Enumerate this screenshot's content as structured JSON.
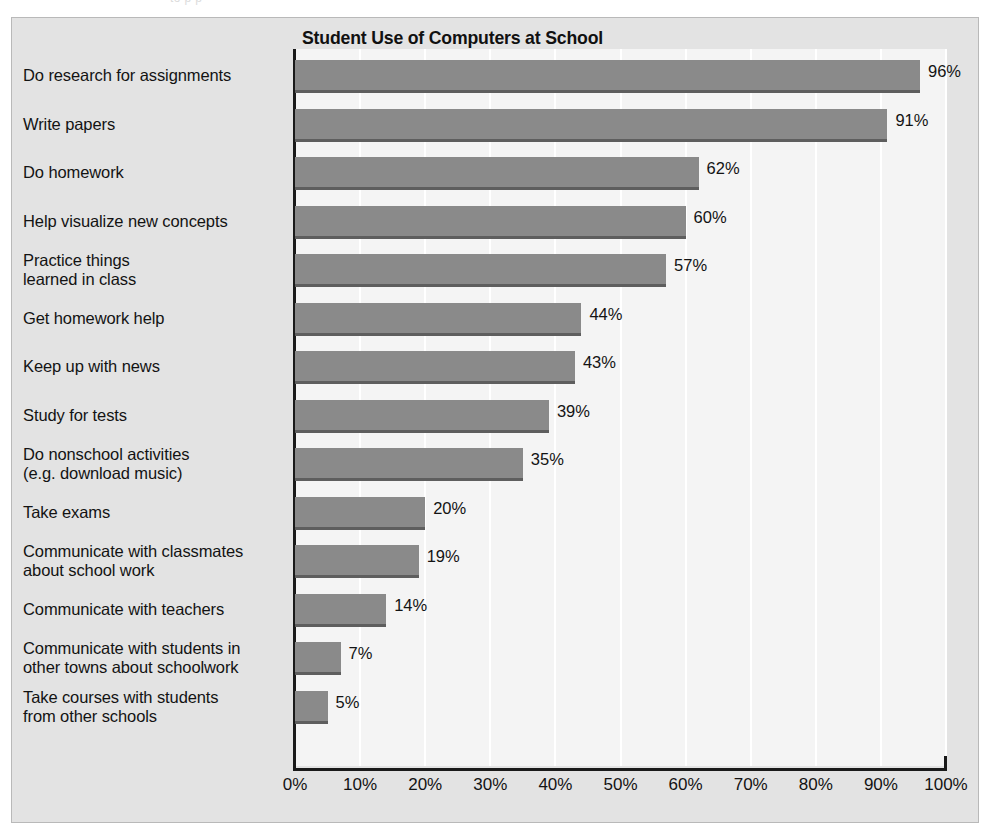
{
  "figure": {
    "ghost_caption": "to  p           p                                                                                                  "
  },
  "chart_data": {
    "type": "bar",
    "orientation": "horizontal",
    "title": "Student Use of Computers at School",
    "xlabel": "",
    "ylabel": "",
    "xlim": [
      0,
      100
    ],
    "grid": true,
    "legend": null,
    "bar_color": "#8a8a8a",
    "categories": [
      "Do research for assignments",
      "Write papers",
      "Do homework",
      "Help visualize new concepts",
      "Practice things\nlearned in class",
      "Get homework help",
      "Keep up with news",
      "Study for tests",
      "Do nonschool activities\n(e.g. download music)",
      "Take exams",
      "Communicate with classmates\nabout school work",
      "Communicate with teachers",
      "Communicate with students in\nother towns about schoolwork",
      "Take courses with students\nfrom other schools"
    ],
    "values": [
      96,
      91,
      62,
      60,
      57,
      44,
      43,
      39,
      35,
      20,
      19,
      14,
      7,
      5
    ],
    "value_labels": [
      "96%",
      "91%",
      "62%",
      "60%",
      "57%",
      "44%",
      "43%",
      "39%",
      "35%",
      "20%",
      "19%",
      "14%",
      "7%",
      "5%"
    ],
    "tick_values": [
      0,
      10,
      20,
      30,
      40,
      50,
      60,
      70,
      80,
      90,
      100
    ],
    "tick_labels": [
      "0%",
      "10%",
      "20%",
      "30%",
      "40%",
      "50%",
      "60%",
      "70%",
      "80%",
      "90%",
      "100%"
    ]
  }
}
